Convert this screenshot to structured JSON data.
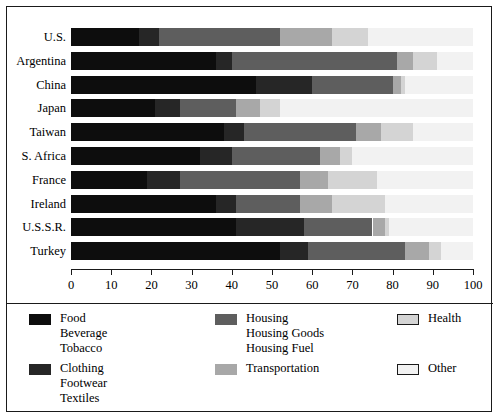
{
  "chart_data": {
    "type": "bar",
    "orientation": "horizontal",
    "stacked": true,
    "title": "",
    "subtitle": "",
    "xlabel": "",
    "ylabel": "",
    "xlim": [
      0,
      100
    ],
    "xticks": [
      0,
      10,
      20,
      30,
      40,
      50,
      60,
      70,
      80,
      90,
      100
    ],
    "xtick_labels": [
      "0",
      "10",
      "20",
      "30",
      "40",
      "50",
      "60",
      "70",
      "80",
      "90",
      "100"
    ],
    "grid": false,
    "legend_position": "bottom",
    "legend_columns": 3,
    "categories": [
      "U.S.",
      "Argentina",
      "China",
      "Japan",
      "Taiwan",
      "S. Africa",
      "France",
      "Ireland",
      "U.S.S.R.",
      "Turkey"
    ],
    "series": [
      {
        "name": "Food\nBeverage\nTobacco",
        "short_name": "Food",
        "color": "#0d0d0d",
        "values": [
          17,
          36,
          46,
          21,
          38,
          32,
          19,
          36,
          41,
          52
        ]
      },
      {
        "name": "Clothing\nFootwear\nTextiles",
        "short_name": "Clothing",
        "color": "#262626",
        "values": [
          5,
          4,
          14,
          6,
          5,
          8,
          8,
          5,
          17,
          7
        ]
      },
      {
        "name": "Housing\nHousing Goods\nHousing Fuel",
        "short_name": "Housing",
        "color": "#5e5e5e",
        "values": [
          30,
          41,
          20,
          14,
          28,
          22,
          30,
          16,
          17,
          24
        ]
      },
      {
        "name": "Transportation",
        "short_name": "Transportation",
        "color": "#a8a8a8",
        "values": [
          13,
          4,
          2,
          6,
          6,
          5,
          7,
          8,
          3,
          6
        ]
      },
      {
        "name": "Health",
        "short_name": "Health",
        "color": "#d4d4d4",
        "values": [
          9,
          6,
          1,
          5,
          8,
          3,
          12,
          13,
          1,
          3
        ]
      },
      {
        "name": "Other",
        "short_name": "Other",
        "color": "#f2f2f2",
        "values": [
          26,
          9,
          17,
          48,
          15,
          30,
          24,
          22,
          21,
          8
        ]
      }
    ],
    "cumulative_boundaries": [
      {
        "category": "U.S.",
        "edges": [
          17,
          22,
          52,
          65,
          74,
          100
        ]
      },
      {
        "category": "Argentina",
        "edges": [
          36,
          40,
          81,
          85,
          91,
          100
        ]
      },
      {
        "category": "China",
        "edges": [
          46,
          60,
          80,
          82,
          83,
          100
        ]
      },
      {
        "category": "Japan",
        "edges": [
          21,
          27,
          41,
          47,
          52,
          100
        ]
      },
      {
        "category": "Taiwan",
        "edges": [
          38,
          43,
          71,
          77,
          85,
          100
        ]
      },
      {
        "category": "S. Africa",
        "edges": [
          32,
          40,
          62,
          67,
          70,
          100
        ]
      },
      {
        "category": "France",
        "edges": [
          19,
          27,
          57,
          64,
          76,
          100
        ]
      },
      {
        "category": "Ireland",
        "edges": [
          36,
          41,
          57,
          65,
          78,
          100
        ]
      },
      {
        "category": "U.S.S.R.",
        "edges": [
          41,
          58,
          75,
          78,
          79,
          100
        ]
      },
      {
        "category": "Turkey",
        "edges": [
          52,
          59,
          83,
          89,
          92,
          100
        ]
      }
    ]
  },
  "legend": {
    "items": [
      {
        "label": "Food\nBeverage\nTobacco",
        "color": "#0d0d0d",
        "outline": false,
        "column": 0,
        "row": 0
      },
      {
        "label": "Clothing\nFootwear\nTextiles",
        "color": "#262626",
        "outline": false,
        "column": 0,
        "row": 1
      },
      {
        "label": "Housing\nHousing Goods\nHousing Fuel",
        "color": "#5e5e5e",
        "outline": false,
        "column": 1,
        "row": 0
      },
      {
        "label": "Transportation",
        "color": "#a8a8a8",
        "outline": false,
        "column": 1,
        "row": 1
      },
      {
        "label": "Health",
        "color": "#d4d4d4",
        "outline": true,
        "column": 2,
        "row": 0
      },
      {
        "label": "Other",
        "color": "#f2f2f2",
        "outline": true,
        "column": 2,
        "row": 1
      }
    ]
  }
}
